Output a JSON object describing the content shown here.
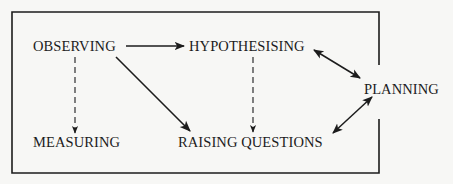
{
  "diagram": {
    "type": "process-flow",
    "colors": {
      "background": "#f7f7f5",
      "ink": "#1c1c1c"
    },
    "nodes": {
      "observing": "OBSERVING",
      "hypothesising": "HYPOTHESISING",
      "planning": "PLANNING",
      "measuring": "MEASURING",
      "raising_questions": "RAISING QUESTIONS"
    },
    "edges": [
      {
        "from": "OBSERVING",
        "to": "HYPOTHESISING",
        "style": "solid",
        "direction": "forward"
      },
      {
        "from": "OBSERVING",
        "to": "MEASURING",
        "style": "dashed",
        "direction": "forward"
      },
      {
        "from": "OBSERVING",
        "to": "RAISING QUESTIONS",
        "style": "solid",
        "direction": "forward"
      },
      {
        "from": "HYPOTHESISING",
        "to": "RAISING QUESTIONS",
        "style": "dashed",
        "direction": "forward"
      },
      {
        "from": "HYPOTHESISING",
        "to": "PLANNING",
        "style": "solid",
        "direction": "both"
      },
      {
        "from": "RAISING QUESTIONS",
        "to": "PLANNING",
        "style": "solid",
        "direction": "both"
      }
    ]
  }
}
